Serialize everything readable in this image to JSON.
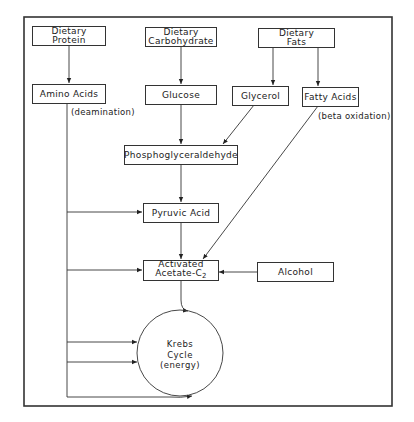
{
  "diagram": {
    "nodes": {
      "dietary_protein": {
        "line1": "Dietary",
        "line2": "Protein"
      },
      "dietary_carbohydrate": {
        "line1": "Dietary",
        "line2": "Carbohydrate"
      },
      "dietary_fats": {
        "line1": "Dietary",
        "line2": "Fats"
      },
      "amino_acids": {
        "label": "Amino Acids"
      },
      "glucose": {
        "label": "Glucose"
      },
      "glycerol": {
        "label": "Glycerol"
      },
      "fatty_acids": {
        "label": "Fatty Acids"
      },
      "phosphoglyceraldehyde": {
        "label": "Phosphoglyceraldehyde"
      },
      "pyruvic_acid": {
        "label": "Pyruvic Acid"
      },
      "activated_acetate": {
        "line1": "Activated",
        "line2": "Acetate-C",
        "subscript": "2"
      },
      "alcohol": {
        "label": "Alcohol"
      },
      "krebs_cycle": {
        "line1": "Krebs",
        "line2": "Cycle",
        "line3": "(energy)"
      }
    },
    "annotations": {
      "deamination": "(deamination)",
      "beta_oxidation": "(beta oxidation)"
    },
    "edges": [
      {
        "from": "Dietary Protein",
        "to": "Amino Acids"
      },
      {
        "from": "Dietary Carbohydrate",
        "to": "Glucose"
      },
      {
        "from": "Dietary Fats",
        "to": "Glycerol"
      },
      {
        "from": "Dietary Fats",
        "to": "Fatty Acids"
      },
      {
        "from": "Glucose",
        "to": "Phosphoglyceraldehyde"
      },
      {
        "from": "Glycerol",
        "to": "Phosphoglyceraldehyde"
      },
      {
        "from": "Phosphoglyceraldehyde",
        "to": "Pyruvic Acid"
      },
      {
        "from": "Pyruvic Acid",
        "to": "Activated Acetate-C2"
      },
      {
        "from": "Fatty Acids",
        "to": "Activated Acetate-C2",
        "label": "(beta oxidation)"
      },
      {
        "from": "Alcohol",
        "to": "Activated Acetate-C2"
      },
      {
        "from": "Activated Acetate-C2",
        "to": "Krebs Cycle"
      },
      {
        "from": "Amino Acids",
        "to": "Pyruvic Acid",
        "label": "(deamination)"
      },
      {
        "from": "Amino Acids",
        "to": "Activated Acetate-C2"
      },
      {
        "from": "Amino Acids",
        "to": "Krebs Cycle"
      },
      {
        "from": "Amino Acids",
        "to": "Krebs Cycle"
      },
      {
        "from": "Amino Acids",
        "to": "Krebs Cycle"
      }
    ],
    "colors": {
      "line": "#333333",
      "text": "#222222",
      "background": "#ffffff"
    }
  }
}
